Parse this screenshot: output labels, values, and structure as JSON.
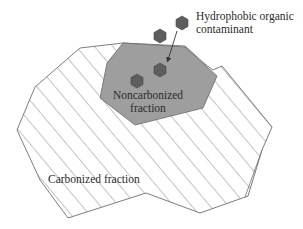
{
  "diagram": {
    "labels": {
      "contaminant_line1": "Hydrophobic organic",
      "contaminant_line2": "contaminant",
      "noncarbonized_line1": "Noncarbonized",
      "noncarbonized_line2": "fraction",
      "carbonized": "Carbonized fraction"
    },
    "colors": {
      "background": "#ffffff",
      "outline": "#6e6e6e",
      "hatch": "#7a7a7a",
      "noncarbonized_fill": "#9e9e9e",
      "hexagon_fill": "#5e5e5e",
      "hexagon_stroke": "#444444",
      "arrow": "#333333",
      "text": "#2b2b2b"
    },
    "elements": {
      "carbonized_region": "hatched polygon",
      "noncarbonized_region": "gray polygon",
      "contaminant_molecules": 4,
      "arrow": "points from label toward noncarbonized fraction"
    }
  }
}
